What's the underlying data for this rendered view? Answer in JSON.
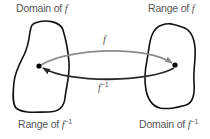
{
  "diagram": {
    "type": "function-inverse-mapping",
    "labels": {
      "top_left": {
        "text": "Domain of ",
        "var": "f",
        "sup": ""
      },
      "top_right": {
        "text": "Range of ",
        "var": "f",
        "sup": ""
      },
      "bottom_left": {
        "text": "Range of ",
        "var": "f",
        "sup": "−1"
      },
      "bottom_right": {
        "text": "Domain of ",
        "var": "f",
        "sup": "−1"
      }
    },
    "arrows": {
      "forward": {
        "var": "f",
        "sup": "",
        "color": "#8c8c8c"
      },
      "inverse": {
        "var": "f",
        "sup": "−1",
        "color": "#2b2b2b"
      }
    },
    "colors": {
      "blob_stroke": "#111111",
      "point": "#000000",
      "label_text": "#555555"
    }
  }
}
